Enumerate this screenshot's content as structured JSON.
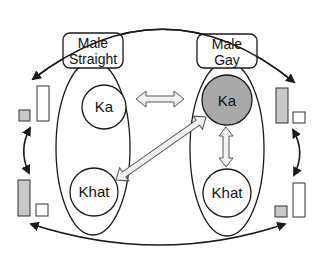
{
  "diagram": {
    "groups": [
      {
        "id": "male-straight",
        "label_line1": "Male",
        "label_line2": "Straight",
        "nodes": [
          {
            "label": "Ka",
            "highlighted": false
          },
          {
            "label": "Khat",
            "highlighted": false
          }
        ]
      },
      {
        "id": "male-gay",
        "label_line1": "Male",
        "label_line2": "Gay",
        "nodes": [
          {
            "label": "Ka",
            "highlighted": true
          },
          {
            "label": "Khat",
            "highlighted": false
          }
        ]
      }
    ],
    "connections": [
      {
        "from": "male-straight.Ka",
        "to": "male-gay.Ka",
        "type": "double-block-arrow"
      },
      {
        "from": "male-straight.Khat",
        "to": "male-gay.Ka",
        "type": "double-block-arrow"
      },
      {
        "from": "male-gay.Ka",
        "to": "male-gay.Khat",
        "type": "double-block-arrow"
      }
    ],
    "bar_pairs": [
      {
        "position": "left-top",
        "bars": [
          {
            "fill": "gray",
            "size": "short"
          },
          {
            "fill": "white",
            "size": "tall"
          }
        ]
      },
      {
        "position": "left-bottom",
        "bars": [
          {
            "fill": "gray",
            "size": "tall"
          },
          {
            "fill": "white",
            "size": "short"
          }
        ]
      },
      {
        "position": "right-top",
        "bars": [
          {
            "fill": "gray",
            "size": "tall"
          },
          {
            "fill": "white",
            "size": "short"
          }
        ]
      },
      {
        "position": "right-bottom",
        "bars": [
          {
            "fill": "gray",
            "size": "short"
          },
          {
            "fill": "white",
            "size": "tall"
          }
        ]
      }
    ],
    "colors": {
      "highlight_fill": "#a9a9a9",
      "bar_gray": "#c8c8c8",
      "arrow_fill": "#f2f2f2",
      "stroke": "#1a1a1a"
    }
  }
}
